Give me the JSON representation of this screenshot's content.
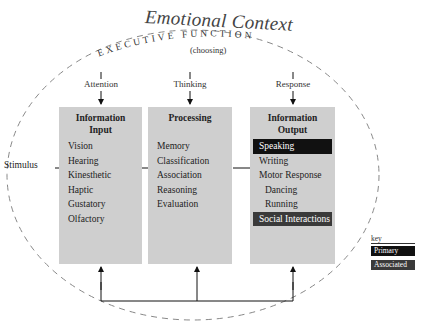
{
  "title": "Emotional Context",
  "executive": {
    "label": "EXECUTIVE FUNCTION",
    "sub": "(choosing)"
  },
  "stages": [
    {
      "label": "Attention"
    },
    {
      "label": "Thinking"
    },
    {
      "label": "Response"
    }
  ],
  "boxes": [
    {
      "title_line1": "Information",
      "title_line2": "Input",
      "items": [
        "Vision",
        "Hearing",
        "Kinesthetic",
        "Haptic",
        "Gustatory",
        "Olfactory"
      ]
    },
    {
      "title_line1": "Processing",
      "title_line2": "",
      "items": [
        "Memory",
        "Classification",
        "Association",
        "Reasoning",
        "Evaluation"
      ]
    },
    {
      "title_line1": "Information",
      "title_line2": "Output",
      "items": [
        "Speaking",
        "Writing",
        "Motor Response",
        "Dancing",
        "Running",
        "Social Interactions"
      ]
    }
  ],
  "input_label": "Stimulus",
  "key": {
    "label": "key",
    "primary": "Primary",
    "associated": "Associated"
  },
  "colors": {
    "box_fill": "#cfcfcf",
    "primary": "#111111",
    "associated": "#3a3a3a"
  }
}
